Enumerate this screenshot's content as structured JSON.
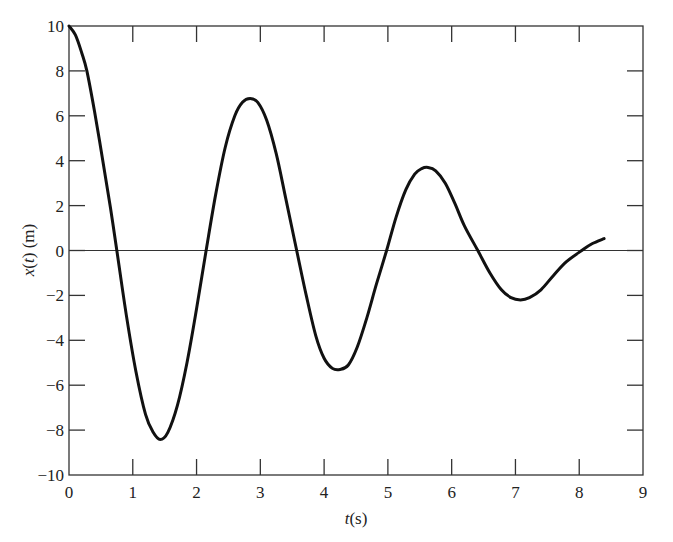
{
  "chart_data": {
    "type": "line",
    "title": "",
    "xlabel": "t(s)",
    "ylabel": "x(t) (m)",
    "xlim": [
      0,
      9
    ],
    "ylim": [
      -10,
      10
    ],
    "xticks": [
      0,
      1,
      2,
      3,
      4,
      5,
      6,
      7,
      8,
      9
    ],
    "yticks": [
      -10,
      -8,
      -6,
      -4,
      -2,
      0,
      2,
      4,
      6,
      8,
      10
    ],
    "grid": false,
    "legend": null,
    "zero_line": true,
    "series": [
      {
        "name": "x(t)",
        "color": "#111111",
        "x": [
          0,
          0.1,
          0.2,
          0.28,
          0.4,
          0.53,
          0.65,
          0.75,
          0.9,
          1.05,
          1.2,
          1.32,
          1.43,
          1.55,
          1.7,
          1.85,
          2.0,
          2.15,
          2.3,
          2.45,
          2.6,
          2.72,
          2.84,
          2.96,
          3.1,
          3.25,
          3.4,
          3.57,
          3.72,
          3.87,
          4.0,
          4.13,
          4.25,
          4.38,
          4.52,
          4.67,
          4.82,
          4.98,
          5.13,
          5.28,
          5.42,
          5.53,
          5.63,
          5.75,
          5.9,
          6.05,
          6.2,
          6.41,
          6.6,
          6.78,
          6.93,
          7.08,
          7.22,
          7.4,
          7.6,
          7.8,
          8.04,
          8.2,
          8.39
        ],
        "y": [
          10,
          9.6,
          8.8,
          8.0,
          6.2,
          4.0,
          1.9,
          0.0,
          -2.9,
          -5.4,
          -7.3,
          -8.1,
          -8.42,
          -8.1,
          -6.9,
          -5.0,
          -2.6,
          0.0,
          2.5,
          4.6,
          6.0,
          6.6,
          6.77,
          6.6,
          5.8,
          4.3,
          2.3,
          0.0,
          -2.0,
          -3.8,
          -4.8,
          -5.25,
          -5.3,
          -5.1,
          -4.3,
          -3.0,
          -1.5,
          0.0,
          1.5,
          2.7,
          3.4,
          3.65,
          3.7,
          3.55,
          3.0,
          2.1,
          1.1,
          0.0,
          -1.0,
          -1.75,
          -2.1,
          -2.2,
          -2.1,
          -1.75,
          -1.1,
          -0.5,
          0.0,
          0.3,
          0.53
        ]
      }
    ]
  }
}
